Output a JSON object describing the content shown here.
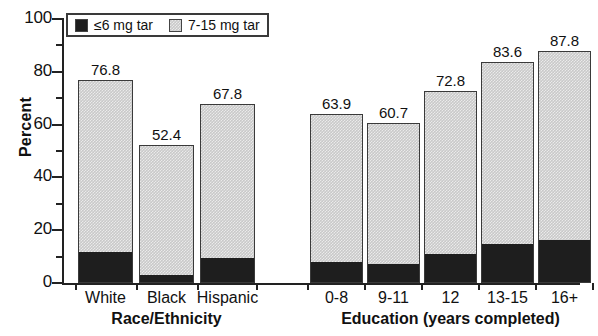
{
  "chart_data": {
    "type": "bar",
    "subtype": "stacked",
    "title": "",
    "xlabel": "",
    "ylabel": "Percent",
    "ylim": [
      0,
      100
    ],
    "ytick_step": 20,
    "yminor_step": 10,
    "ytick_labels": [
      "0",
      "20",
      "40",
      "60",
      "80",
      "100"
    ],
    "grid": false,
    "legend_position": "top-left-inside",
    "legend": [
      "≤6 mg tar",
      "7-15 mg tar"
    ],
    "groups": [
      {
        "name": "Race/Ethnicity",
        "categories": [
          "White",
          "Black",
          "Hispanic"
        ],
        "totals": [
          76.8,
          52.4,
          67.8
        ],
        "series": [
          {
            "name": "≤6 mg tar",
            "values": [
              11.5,
              2.5,
              9.0
            ]
          },
          {
            "name": "7-15 mg tar",
            "values": [
              65.3,
              49.9,
              58.8
            ]
          }
        ]
      },
      {
        "name": "Education (years completed)",
        "categories": [
          "0-8",
          "9-11",
          "12",
          "13-15",
          "16+"
        ],
        "totals": [
          63.9,
          60.7,
          72.8,
          83.6,
          87.8
        ],
        "series": [
          {
            "name": "≤6 mg tar",
            "values": [
              7.5,
              7.0,
              10.5,
              14.5,
              16.0
            ]
          },
          {
            "name": "7-15 mg tar",
            "values": [
              56.4,
              53.7,
              62.3,
              69.1,
              71.8
            ]
          }
        ]
      }
    ],
    "colors": {
      "dark_segment": "#1e1e1e",
      "light_segment": "#c9c9c9",
      "axis": "#222222",
      "text": "#111111"
    }
  }
}
